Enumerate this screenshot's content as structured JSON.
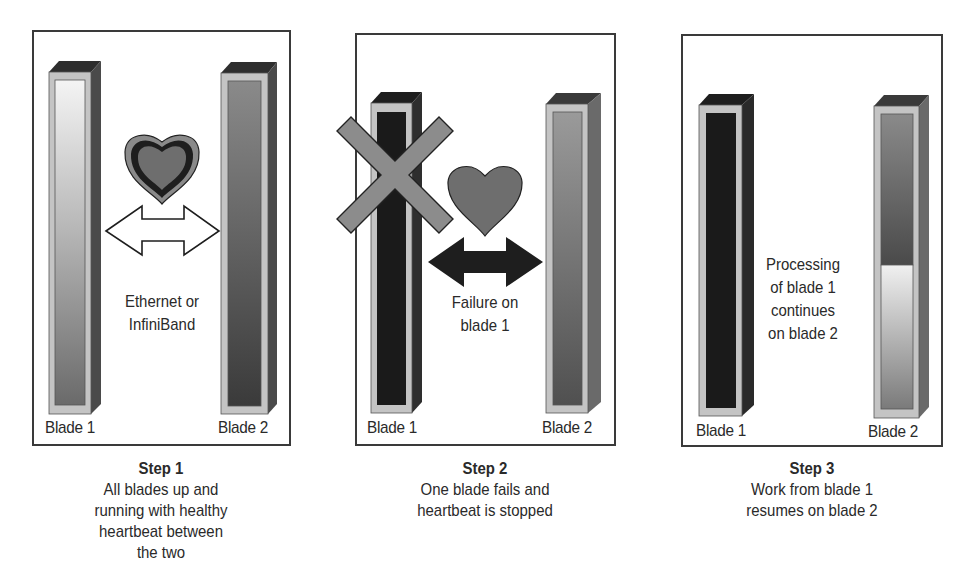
{
  "colors": {
    "border": "#3a3a3a",
    "blade_frame": "#c4c4c4",
    "blade_top": "#2e2e2e",
    "blade_side": "#4a4a4a",
    "failed_blade": "#1c1c1c",
    "x_mark": "#8a8a8a",
    "heart_fill": "#6e6e6e"
  },
  "panels": [
    {
      "id": "step1",
      "blade1_label": "Blade 1",
      "blade2_label": "Blade 2",
      "link_text": [
        "Ethernet or",
        "InfiniBand"
      ],
      "heartbeat": "healthy",
      "caption": {
        "step": "Step 1",
        "lines": [
          "All blades up and",
          "running with healthy",
          "heartbeat between",
          "the two"
        ]
      }
    },
    {
      "id": "step2",
      "blade1_label": "Blade 1",
      "blade2_label": "Blade 2",
      "link_text": [
        "Failure on",
        "blade 1"
      ],
      "heartbeat": "stopped",
      "caption": {
        "step": "Step 2",
        "lines": [
          "One blade fails and",
          "heartbeat is stopped"
        ]
      }
    },
    {
      "id": "step3",
      "blade1_label": "Blade 1",
      "blade2_label": "Blade 2",
      "link_text": [
        "Processing",
        "of blade 1",
        "continues",
        "on blade 2"
      ],
      "caption": {
        "step": "Step 3",
        "lines": [
          "Work from blade 1",
          "resumes on blade 2"
        ]
      }
    }
  ]
}
